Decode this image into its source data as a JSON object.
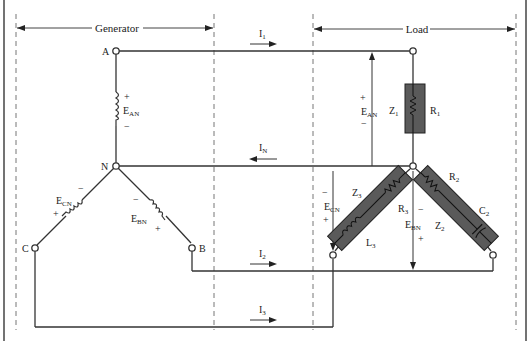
{
  "figure": {
    "type": "three-phase Y-connected generator and Y-connected load circuit",
    "sections": {
      "generator": "Generator",
      "load": "Load"
    },
    "nodes": {
      "a": "A",
      "n": "N",
      "b": "B",
      "c": "C"
    },
    "currents": {
      "i1": {
        "main": "I",
        "sub": "1",
        "direction": "right"
      },
      "in": {
        "main": "I",
        "sub": "N",
        "direction": "left"
      },
      "i2": {
        "main": "I",
        "sub": "2",
        "direction": "right"
      },
      "i3": {
        "main": "I",
        "sub": "3",
        "direction": "right"
      }
    },
    "generator_voltages": {
      "ean": {
        "main": "E",
        "sub": "AN",
        "plus": "+",
        "minus": "−"
      },
      "ebn": {
        "main": "E",
        "sub": "BN",
        "plus": "+",
        "minus": "−"
      },
      "ecn": {
        "main": "E",
        "sub": "CN",
        "plus": "+",
        "minus": "−"
      }
    },
    "load_voltages": {
      "ean": {
        "main": "E",
        "sub": "AN",
        "plus": "+",
        "minus": "−"
      },
      "ebn": {
        "main": "E",
        "sub": "BN",
        "plus": "+",
        "minus": "−"
      },
      "ecn": {
        "main": "E",
        "sub": "CN",
        "plus": "+",
        "minus": "−"
      }
    },
    "load_impedances": {
      "z1": {
        "main": "Z",
        "sub": "1",
        "elements": [
          {
            "main": "R",
            "sub": "1"
          }
        ]
      },
      "z2": {
        "main": "Z",
        "sub": "2",
        "elements": [
          {
            "main": "R",
            "sub": "2"
          },
          {
            "main": "C",
            "sub": "2"
          }
        ]
      },
      "z3": {
        "main": "Z",
        "sub": "3",
        "elements": [
          {
            "main": "R",
            "sub": "3"
          },
          {
            "main": "L",
            "sub": "3"
          }
        ]
      }
    },
    "colors": {
      "wire": "#333333",
      "impedance_fill": "#5a5a5a",
      "dashed": "#777777",
      "background": "#ffffff"
    }
  }
}
